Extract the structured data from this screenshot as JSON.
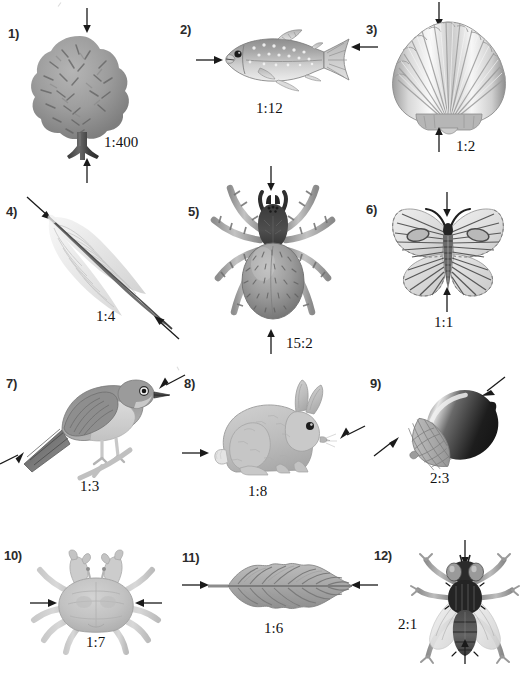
{
  "worksheet": {
    "background_color": "#ffffff",
    "ink_color": "#1a1a1a",
    "artwork_gray_mid": "#9a9a9a",
    "artwork_gray_dark": "#4a4a4a",
    "artwork_gray_light": "#d6d6d6"
  },
  "items": [
    {
      "number": "1)",
      "subject": "tree",
      "ratio": "1:400",
      "arrow_orientation": "vertical",
      "arrow_direction": "inward",
      "measured_dimension": "height"
    },
    {
      "number": "2)",
      "subject": "fish",
      "ratio": "1:12",
      "arrow_orientation": "horizontal",
      "arrow_direction": "inward",
      "measured_dimension": "length"
    },
    {
      "number": "3)",
      "subject": "scallop-shell",
      "ratio": "1:2",
      "arrow_orientation": "vertical",
      "arrow_direction": "inward",
      "measured_dimension": "height"
    },
    {
      "number": "4)",
      "subject": "feather",
      "ratio": "1:4",
      "arrow_orientation": "diagonal",
      "arrow_direction": "inward",
      "measured_dimension": "length"
    },
    {
      "number": "5)",
      "subject": "spider",
      "ratio": "15:2",
      "arrow_orientation": "vertical",
      "arrow_direction": "inward",
      "measured_dimension": "body-length"
    },
    {
      "number": "6)",
      "subject": "butterfly",
      "ratio": "1:1",
      "arrow_orientation": "vertical",
      "arrow_direction": "inward",
      "measured_dimension": "body-length"
    },
    {
      "number": "7)",
      "subject": "bird",
      "ratio": "1:3",
      "arrow_orientation": "diagonal",
      "arrow_direction": "inward",
      "measured_dimension": "length"
    },
    {
      "number": "8)",
      "subject": "rabbit",
      "ratio": "1:8",
      "arrow_orientation": "horizontal",
      "arrow_direction": "inward",
      "measured_dimension": "length"
    },
    {
      "number": "9)",
      "subject": "acorn",
      "ratio": "2:3",
      "arrow_orientation": "diagonal",
      "arrow_direction": "inward",
      "measured_dimension": "length"
    },
    {
      "number": "10)",
      "subject": "crab",
      "ratio": "1:7",
      "arrow_orientation": "horizontal",
      "arrow_direction": "inward",
      "measured_dimension": "carapace-width"
    },
    {
      "number": "11)",
      "subject": "leaf",
      "ratio": "1:6",
      "arrow_orientation": "horizontal",
      "arrow_direction": "inward",
      "measured_dimension": "length"
    },
    {
      "number": "12)",
      "subject": "fly",
      "ratio": "2:1",
      "arrow_orientation": "vertical",
      "arrow_direction": "inward",
      "measured_dimension": "body-length"
    }
  ]
}
